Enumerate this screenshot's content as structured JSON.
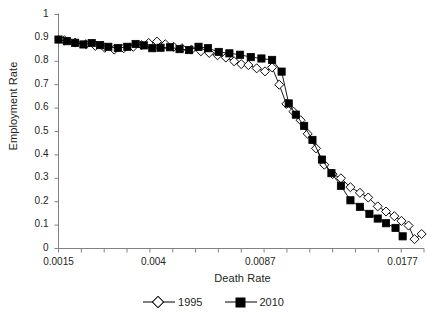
{
  "top_artifact": "",
  "chart_data": {
    "type": "line",
    "title": "",
    "xlabel": "Death Rate",
    "ylabel": "Employment Rate",
    "xlim": [
      0.0015,
      0.0215
    ],
    "ylim": [
      0,
      1
    ],
    "grid": false,
    "legend_position": "bottom",
    "y_ticks": [
      "0",
      "0.1",
      "0.2",
      "0.3",
      "0.4",
      "0.5",
      "0.6",
      "0.7",
      "0.8",
      "0.9",
      "1"
    ],
    "y_tick_values": [
      0,
      0.1,
      0.2,
      0.3,
      0.4,
      0.5,
      0.6,
      0.7,
      0.8,
      0.9,
      1
    ],
    "x_ticks": [
      "0.0015",
      "0.004",
      "0.0087",
      "0.0177"
    ],
    "x_tick_values": [
      0.0015,
      0.004,
      0.0087,
      0.0177
    ],
    "x_tick_positions": [
      0,
      8,
      17,
      29
    ],
    "x_minor_tick_count": 16,
    "series": [
      {
        "name": "1995",
        "marker": "open-diamond",
        "color": "#000000",
        "points": [
          [
            0.5,
            0.89
          ],
          [
            1.4,
            0.88
          ],
          [
            2.3,
            0.873
          ],
          [
            3.1,
            0.866
          ],
          [
            3.9,
            0.858
          ],
          [
            4.7,
            0.85
          ],
          [
            5.5,
            0.856
          ],
          [
            6.3,
            0.862
          ],
          [
            7.0,
            0.869
          ],
          [
            7.6,
            0.878
          ],
          [
            8.3,
            0.884
          ],
          [
            9.0,
            0.873
          ],
          [
            9.7,
            0.862
          ],
          [
            10.4,
            0.856
          ],
          [
            11.2,
            0.85
          ],
          [
            12.0,
            0.843
          ],
          [
            12.7,
            0.836
          ],
          [
            13.4,
            0.826
          ],
          [
            14.1,
            0.816
          ],
          [
            14.8,
            0.8
          ],
          [
            15.4,
            0.788
          ],
          [
            16.0,
            0.784
          ],
          [
            16.7,
            0.77
          ],
          [
            17.4,
            0.757
          ],
          [
            18.0,
            0.774
          ],
          [
            18.6,
            0.7
          ],
          [
            19.2,
            0.618
          ],
          [
            19.8,
            0.585
          ],
          [
            20.4,
            0.548
          ],
          [
            21.0,
            0.49
          ],
          [
            21.7,
            0.428
          ],
          [
            22.4,
            0.358
          ],
          [
            23.1,
            0.318
          ],
          [
            23.8,
            0.3
          ],
          [
            24.6,
            0.262
          ],
          [
            25.4,
            0.238
          ],
          [
            26.1,
            0.218
          ],
          [
            26.9,
            0.18
          ],
          [
            27.6,
            0.158
          ],
          [
            28.3,
            0.138
          ],
          [
            28.9,
            0.118
          ],
          [
            29.5,
            0.098
          ],
          [
            30.0,
            0.04
          ],
          [
            30.6,
            0.062
          ]
        ]
      },
      {
        "name": "2010",
        "marker": "filled-square",
        "color": "#000000",
        "points": [
          [
            0.0,
            0.893
          ],
          [
            0.7,
            0.886
          ],
          [
            1.4,
            0.879
          ],
          [
            2.1,
            0.872
          ],
          [
            2.8,
            0.878
          ],
          [
            3.5,
            0.869
          ],
          [
            4.2,
            0.862
          ],
          [
            5.0,
            0.857
          ],
          [
            5.8,
            0.862
          ],
          [
            6.5,
            0.874
          ],
          [
            7.2,
            0.868
          ],
          [
            7.9,
            0.856
          ],
          [
            8.6,
            0.858
          ],
          [
            9.4,
            0.86
          ],
          [
            10.2,
            0.852
          ],
          [
            11.0,
            0.848
          ],
          [
            11.8,
            0.862
          ],
          [
            12.6,
            0.856
          ],
          [
            13.5,
            0.84
          ],
          [
            14.4,
            0.834
          ],
          [
            15.3,
            0.828
          ],
          [
            16.2,
            0.818
          ],
          [
            17.1,
            0.812
          ],
          [
            18.0,
            0.806
          ],
          [
            18.8,
            0.756
          ],
          [
            19.4,
            0.62
          ],
          [
            20.0,
            0.572
          ],
          [
            20.7,
            0.524
          ],
          [
            21.4,
            0.464
          ],
          [
            22.2,
            0.38
          ],
          [
            23.0,
            0.322
          ],
          [
            23.8,
            0.268
          ],
          [
            24.6,
            0.206
          ],
          [
            25.4,
            0.178
          ],
          [
            26.2,
            0.148
          ],
          [
            26.9,
            0.128
          ],
          [
            27.6,
            0.108
          ],
          [
            28.4,
            0.088
          ],
          [
            29.0,
            0.052
          ]
        ]
      }
    ]
  }
}
